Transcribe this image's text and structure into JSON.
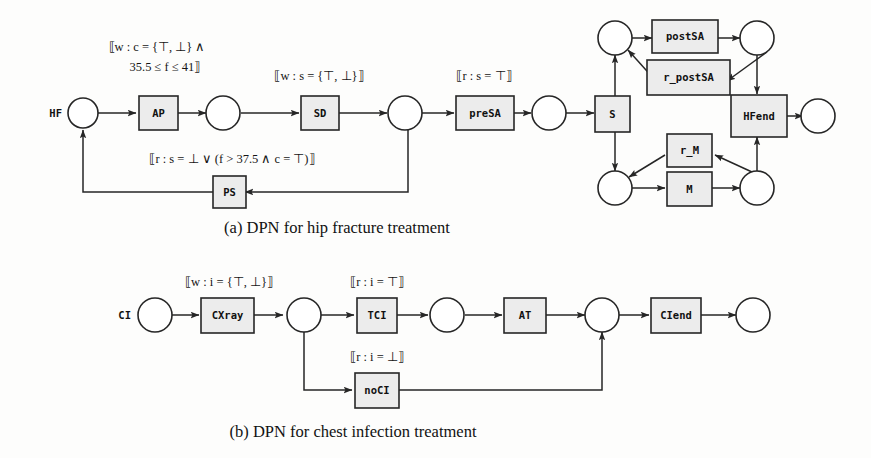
{
  "figure": {
    "subfigures": [
      {
        "id": "a",
        "caption": "(a) DPN for hip fracture treatment",
        "start_label": "HF",
        "transitions": [
          {
            "name": "AP"
          },
          {
            "name": "SD"
          },
          {
            "name": "PS"
          },
          {
            "name": "preSA"
          },
          {
            "name": "S"
          },
          {
            "name": "postSA"
          },
          {
            "name": "r_postSA"
          },
          {
            "name": "r_M"
          },
          {
            "name": "M"
          },
          {
            "name": "HFend"
          }
        ],
        "guards": [
          {
            "for": "AP",
            "line1": "⟦w : c = {⊤, ⊥} ∧",
            "line2": "35.5 ≤ f ≤ 41⟧"
          },
          {
            "for": "SD",
            "line1": "⟦w : s = {⊤, ⊥}⟧",
            "line2": ""
          },
          {
            "for": "PS",
            "line1": "⟦r : s = ⊥ ∨ (f > 37.5 ∧ c = ⊤)⟧",
            "line2": ""
          },
          {
            "for": "preSA",
            "line1": "⟦r : s = ⊤⟧",
            "line2": ""
          }
        ]
      },
      {
        "id": "b",
        "caption": "(b) DPN for chest infection treatment",
        "start_label": "CI",
        "transitions": [
          {
            "name": "CXray"
          },
          {
            "name": "TCI"
          },
          {
            "name": "AT"
          },
          {
            "name": "noCI"
          },
          {
            "name": "CIend"
          }
        ],
        "guards": [
          {
            "for": "CXray",
            "line1": "⟦w : i = {⊤, ⊥}⟧",
            "line2": ""
          },
          {
            "for": "TCI",
            "line1": "⟦r : i = ⊤⟧",
            "line2": ""
          },
          {
            "for": "noCI",
            "line1": "⟦r : i = ⊥⟧",
            "line2": ""
          }
        ]
      }
    ],
    "colors": {
      "transition_fill": "#ececec",
      "place_fill": "#ffffff",
      "stroke": "#262626",
      "background": "#fdfdfc"
    }
  }
}
